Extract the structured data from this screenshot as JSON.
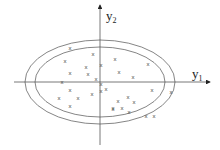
{
  "diagram": {
    "axes": {
      "x_label": "y",
      "x_sub": "1",
      "y_label": "y",
      "y_sub": "2"
    },
    "ellipses": [
      {
        "name": "outer",
        "cx": 100,
        "cy": 82,
        "rx": 75,
        "ry": 42
      },
      {
        "name": "inner",
        "cx": 100,
        "cy": 82,
        "rx": 65,
        "ry": 35
      }
    ],
    "point_marker": "x",
    "points": [
      [
        70,
        48
      ],
      [
        93,
        54
      ],
      [
        115,
        59
      ],
      [
        148,
        64
      ],
      [
        65,
        61
      ],
      [
        86,
        67
      ],
      [
        101,
        65
      ],
      [
        70,
        73
      ],
      [
        88,
        74
      ],
      [
        119,
        72
      ],
      [
        133,
        77
      ],
      [
        96,
        79
      ],
      [
        62,
        82
      ],
      [
        101,
        84
      ],
      [
        101,
        91
      ],
      [
        106,
        89
      ],
      [
        70,
        90
      ],
      [
        92,
        94
      ],
      [
        152,
        90
      ],
      [
        171,
        92
      ],
      [
        59,
        98
      ],
      [
        78,
        98
      ],
      [
        118,
        101
      ],
      [
        128,
        97
      ],
      [
        134,
        102
      ],
      [
        70,
        106
      ],
      [
        113,
        108
      ],
      [
        122,
        108
      ],
      [
        113,
        109
      ],
      [
        129,
        112
      ],
      [
        146,
        116
      ],
      [
        154,
        116
      ]
    ]
  }
}
